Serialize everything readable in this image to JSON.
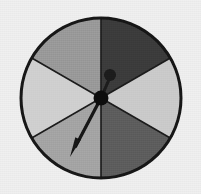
{
  "figure": {
    "name": "spinner-wheel",
    "background_color": "#f1f1f1",
    "canvas": {
      "width": 201,
      "height": 194
    }
  },
  "wheel": {
    "center_x": 101,
    "center_y": 98,
    "radius": 80,
    "rim_color": "#141414",
    "rim_width": 3,
    "divider_color": "#1a1a1a",
    "divider_width": 1.6,
    "sector_count": 6,
    "sector_span_degrees": 60
  },
  "sectors": [
    {
      "id": "sector-1",
      "label": "top-right",
      "start_deg": -90,
      "end_deg": -30,
      "color": "#3b3b3b",
      "shade": "very-dark"
    },
    {
      "id": "sector-2",
      "label": "right",
      "start_deg": -30,
      "end_deg": 30,
      "color": "#c9c9c9",
      "shade": "light"
    },
    {
      "id": "sector-3",
      "label": "bottom-right",
      "start_deg": 30,
      "end_deg": 90,
      "color": "#5c5c5c",
      "shade": "dark"
    },
    {
      "id": "sector-4",
      "label": "bottom-left",
      "start_deg": 90,
      "end_deg": 150,
      "color": "#a3a3a3",
      "shade": "medium"
    },
    {
      "id": "sector-5",
      "label": "left",
      "start_deg": 150,
      "end_deg": 210,
      "color": "#cfcfcf",
      "shade": "light"
    },
    {
      "id": "sector-6",
      "label": "top-left",
      "start_deg": 210,
      "end_deg": 270,
      "color": "#989898",
      "shade": "medium"
    }
  ],
  "pointer": {
    "name": "spinner-needle",
    "color": "#121212",
    "angle_deg": 237,
    "tip_x": 70,
    "tip_y": 157,
    "shaft_width": 3.2,
    "arrowhead_length": 20,
    "arrowhead_width": 9
  },
  "hub": {
    "name": "spinner-hub",
    "color": "#0f0f0f",
    "radius": 7.5,
    "x": 101,
    "y": 98
  },
  "knob": {
    "name": "spinner-knob",
    "color": "#1b1b1b",
    "radius": 6,
    "x": 110,
    "y": 75,
    "stem_width": 3
  },
  "chart_data": {
    "type": "pie",
    "categories": [
      "top-right",
      "right",
      "bottom-right",
      "bottom-left",
      "left",
      "top-left"
    ],
    "values": [
      60,
      60,
      60,
      60,
      60,
      60
    ],
    "value_unit": "degrees",
    "colors": [
      "#3b3b3b",
      "#c9c9c9",
      "#5c5c5c",
      "#a3a3a3",
      "#cfcfcf",
      "#989898"
    ],
    "legend": false,
    "grid": false
  }
}
